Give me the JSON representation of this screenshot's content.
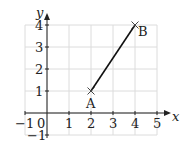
{
  "chart_data": {
    "type": "line",
    "title": "",
    "xlabel": "x",
    "ylabel": "y",
    "xlim": [
      -1,
      5
    ],
    "ylim": [
      -1,
      4
    ],
    "grid": true,
    "x_ticks": [
      "-1",
      "0",
      "1",
      "2",
      "3",
      "4",
      "5"
    ],
    "y_ticks": [
      "-1",
      "1",
      "2",
      "3",
      "4"
    ],
    "origin_label": "0",
    "points": [
      {
        "label": "A",
        "x": 2,
        "y": 1
      },
      {
        "label": "B",
        "x": 4,
        "y": 4
      }
    ],
    "series": [
      {
        "name": "AB",
        "x": [
          2,
          4
        ],
        "y": [
          1,
          4
        ]
      }
    ]
  },
  "colors": {
    "grid": "#dcdcdc",
    "axis": "#222222",
    "segment": "#111111"
  }
}
